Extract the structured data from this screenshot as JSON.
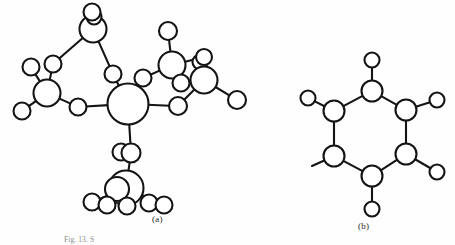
{
  "figure": {
    "background_color": "#fefefe",
    "ink_color": "#141414",
    "panel_a_label": "(a)",
    "panel_b_label": "(b)",
    "caption": "Fig. 13. S",
    "panels": [
      {
        "id": "a",
        "label": "(a)",
        "description": "branched ball-and-stick molecular model"
      },
      {
        "id": "b",
        "label": "(b)",
        "description": "six-membered ring ball-and-stick molecular model"
      }
    ]
  },
  "chart_data": {
    "type": "diagram",
    "title": "",
    "panel_a": {
      "label": "(a)",
      "atoms": [
        {
          "id": "a1",
          "cx": 128,
          "cy": 104,
          "r": 20.5,
          "size": "large"
        },
        {
          "id": "a2",
          "cx": 93,
          "cy": 29,
          "r": 13.5,
          "size": "medium"
        },
        {
          "id": "a3",
          "cx": 94,
          "cy": 17,
          "r": 7.5,
          "size": "small"
        },
        {
          "id": "a4",
          "cx": 92,
          "cy": 12,
          "r": 8.5,
          "size": "small"
        },
        {
          "id": "a5",
          "cx": 47,
          "cy": 93,
          "r": 13.5,
          "size": "medium"
        },
        {
          "id": "a6",
          "cx": 53,
          "cy": 64,
          "r": 8.5,
          "size": "small"
        },
        {
          "id": "a7",
          "cx": 31,
          "cy": 67,
          "r": 8.5,
          "size": "small"
        },
        {
          "id": "a8",
          "cx": 22,
          "cy": 111,
          "r": 8.5,
          "size": "small"
        },
        {
          "id": "a9",
          "cx": 78,
          "cy": 107,
          "r": 8.5,
          "size": "small"
        },
        {
          "id": "a10",
          "cx": 113,
          "cy": 74,
          "r": 8.5,
          "size": "small"
        },
        {
          "id": "a11",
          "cx": 143,
          "cy": 78,
          "r": 8.5,
          "size": "small"
        },
        {
          "id": "a12",
          "cx": 172,
          "cy": 65,
          "r": 13.5,
          "size": "medium"
        },
        {
          "id": "a13",
          "cx": 168,
          "cy": 31,
          "r": 9.0,
          "size": "small"
        },
        {
          "id": "a14",
          "cx": 200,
          "cy": 62,
          "r": 7.5,
          "size": "small"
        },
        {
          "id": "a15",
          "cx": 204,
          "cy": 57,
          "r": 8.0,
          "size": "small"
        },
        {
          "id": "a16",
          "cx": 181,
          "cy": 83,
          "r": 8.5,
          "size": "small"
        },
        {
          "id": "a17",
          "cx": 204,
          "cy": 80,
          "r": 13.5,
          "size": "medium"
        },
        {
          "id": "a18",
          "cx": 237,
          "cy": 100,
          "r": 9.0,
          "size": "small"
        },
        {
          "id": "a19",
          "cx": 178,
          "cy": 106,
          "r": 9.0,
          "size": "small"
        },
        {
          "id": "a20",
          "cx": 121,
          "cy": 152,
          "r": 8.5,
          "size": "small"
        },
        {
          "id": "a21",
          "cx": 131,
          "cy": 153,
          "r": 9.5,
          "size": "small"
        },
        {
          "id": "a22",
          "cx": 126,
          "cy": 188,
          "r": 17.5,
          "size": "large"
        },
        {
          "id": "a23",
          "cx": 117,
          "cy": 189,
          "r": 12.0,
          "size": "medium"
        },
        {
          "id": "a24",
          "cx": 92,
          "cy": 202,
          "r": 8.5,
          "size": "small"
        },
        {
          "id": "a25",
          "cx": 107,
          "cy": 205,
          "r": 8.5,
          "size": "small"
        },
        {
          "id": "a26",
          "cx": 127,
          "cy": 206,
          "r": 8.5,
          "size": "small"
        },
        {
          "id": "a27",
          "cx": 149,
          "cy": 203,
          "r": 8.5,
          "size": "small"
        },
        {
          "id": "a28",
          "cx": 164,
          "cy": 205,
          "r": 8.5,
          "size": "small"
        }
      ],
      "bonds": [
        [
          "a2",
          "a4"
        ],
        [
          "a2",
          "a6"
        ],
        [
          "a2",
          "a10"
        ],
        [
          "a5",
          "a6"
        ],
        [
          "a5",
          "a7"
        ],
        [
          "a5",
          "a8"
        ],
        [
          "a5",
          "a9"
        ],
        [
          "a9",
          "a1"
        ],
        [
          "a10",
          "a1"
        ],
        [
          "a1",
          "a11"
        ],
        [
          "a11",
          "a12"
        ],
        [
          "a12",
          "a13"
        ],
        [
          "a12",
          "a16"
        ],
        [
          "a12",
          "a15"
        ],
        [
          "a17",
          "a15"
        ],
        [
          "a17",
          "a16"
        ],
        [
          "a17",
          "a18"
        ],
        [
          "a17",
          "a19"
        ],
        [
          "a19",
          "a1"
        ],
        [
          "a1",
          "a21"
        ],
        [
          "a21",
          "a20"
        ],
        [
          "a21",
          "a22"
        ],
        [
          "a22",
          "a24"
        ],
        [
          "a22",
          "a25"
        ],
        [
          "a22",
          "a26"
        ],
        [
          "a22",
          "a27"
        ],
        [
          "a22",
          "a28"
        ]
      ]
    },
    "panel_b": {
      "label": "(b)",
      "ring_atoms": [
        {
          "id": "b1",
          "cx": 372,
          "cy": 91,
          "r": 10.5,
          "position": "top"
        },
        {
          "id": "b2",
          "cx": 406,
          "cy": 110,
          "r": 10.5,
          "position": "upper-right"
        },
        {
          "id": "b3",
          "cx": 406,
          "cy": 154,
          "r": 10.5,
          "position": "lower-right"
        },
        {
          "id": "b4",
          "cx": 372,
          "cy": 176,
          "r": 10.5,
          "position": "bottom"
        },
        {
          "id": "b5",
          "cx": 334,
          "cy": 156,
          "r": 10.5,
          "position": "lower-left"
        },
        {
          "id": "b6",
          "cx": 334,
          "cy": 111,
          "r": 10.5,
          "position": "upper-left"
        }
      ],
      "substituent_atoms": [
        {
          "id": "s1",
          "cx": 372,
          "cy": 60,
          "r": 7.5,
          "attached_to": "b1"
        },
        {
          "id": "s2",
          "cx": 437,
          "cy": 100,
          "r": 7.5,
          "attached_to": "b2"
        },
        {
          "id": "s3",
          "cx": 437,
          "cy": 172,
          "r": 7.5,
          "attached_to": "b3"
        },
        {
          "id": "s4",
          "cx": 372,
          "cy": 209,
          "r": 7.5,
          "attached_to": "b4"
        },
        {
          "id": "s6",
          "cx": 308,
          "cy": 98,
          "r": 7.5,
          "attached_to": "b6"
        }
      ],
      "stub_bonds": [
        {
          "from": "b5",
          "to_x": 312,
          "to_y": 166
        }
      ],
      "ring_bonds": [
        [
          "b1",
          "b2"
        ],
        [
          "b2",
          "b3"
        ],
        [
          "b3",
          "b4"
        ],
        [
          "b4",
          "b5"
        ],
        [
          "b5",
          "b6"
        ],
        [
          "b6",
          "b1"
        ]
      ]
    }
  }
}
